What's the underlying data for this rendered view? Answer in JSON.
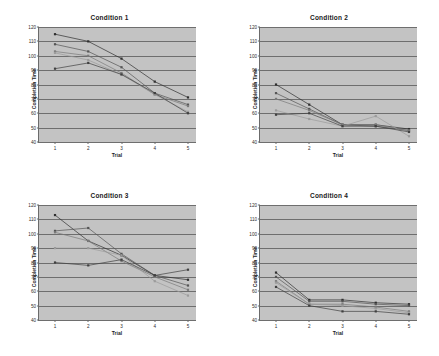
{
  "page": {
    "background": "#ffffff",
    "plot_background": "#c3c3c3",
    "gridline_color": "#6e6e6e",
    "axis_color": "#6b6b6b"
  },
  "axis": {
    "ylabel": "Completion Time",
    "xlabel": "Trial",
    "yticks": [
      "120",
      "110",
      "100",
      "90",
      "80",
      "70",
      "60",
      "50",
      "40"
    ],
    "xticks": [
      "1",
      "2",
      "3",
      "4",
      "5"
    ],
    "ymin": 40,
    "ymax": 120,
    "ystep": 10,
    "xmin": 1,
    "xmax": 5
  },
  "series_colors": [
    "#2f2f2f",
    "#555555",
    "#7a7a7a",
    "#9b9b9b",
    "#404040"
  ],
  "chart_data": [
    {
      "type": "line",
      "title": "Condition 1",
      "xlabel": "Trial",
      "ylabel": "Completion Time",
      "categories": [
        1,
        2,
        3,
        4,
        5
      ],
      "x": [
        1,
        2,
        3,
        4,
        5
      ],
      "xlim": [
        1,
        5
      ],
      "ylim": [
        40,
        120
      ],
      "grid": true,
      "legend": "none",
      "series": [
        {
          "name": "S1",
          "values": [
            115,
            110,
            98,
            82,
            71
          ]
        },
        {
          "name": "S2",
          "values": [
            108,
            103,
            92,
            74,
            66
          ]
        },
        {
          "name": "S3",
          "values": [
            103,
            100,
            88,
            73,
            65
          ]
        },
        {
          "name": "S4",
          "values": [
            102,
            97,
            87,
            73,
            61
          ]
        },
        {
          "name": "S5",
          "values": [
            91,
            95,
            87,
            74,
            60
          ]
        }
      ]
    },
    {
      "type": "line",
      "title": "Condition 2",
      "xlabel": "Trial",
      "ylabel": "Completion Time",
      "categories": [
        1,
        2,
        3,
        4,
        5
      ],
      "x": [
        1,
        2,
        3,
        4,
        5
      ],
      "xlim": [
        1,
        5
      ],
      "ylim": [
        40,
        120
      ],
      "grid": true,
      "legend": "none",
      "series": [
        {
          "name": "S1",
          "values": [
            80,
            66,
            52,
            52,
            49
          ]
        },
        {
          "name": "S2",
          "values": [
            74,
            63,
            52,
            51,
            48
          ]
        },
        {
          "name": "S3",
          "values": [
            70,
            62,
            52,
            52,
            48
          ]
        },
        {
          "name": "S4",
          "values": [
            62,
            56,
            51,
            58,
            44
          ]
        },
        {
          "name": "S5",
          "values": [
            59,
            60,
            51,
            51,
            47
          ]
        }
      ]
    },
    {
      "type": "line",
      "title": "Condition 3",
      "xlabel": "Trial",
      "ylabel": "Completion Time",
      "categories": [
        1,
        2,
        3,
        4,
        5
      ],
      "x": [
        1,
        2,
        3,
        4,
        5
      ],
      "xlim": [
        1,
        5
      ],
      "ylim": [
        40,
        120
      ],
      "grid": true,
      "legend": "none",
      "series": [
        {
          "name": "S1",
          "values": [
            113,
            95,
            85,
            71,
            68
          ]
        },
        {
          "name": "S2",
          "values": [
            102,
            104,
            86,
            71,
            64
          ]
        },
        {
          "name": "S3",
          "values": [
            101,
            95,
            81,
            70,
            61
          ]
        },
        {
          "name": "S4",
          "values": [
            90,
            90,
            85,
            67,
            57
          ]
        },
        {
          "name": "S5",
          "values": [
            80,
            78,
            82,
            71,
            75
          ]
        }
      ]
    },
    {
      "type": "line",
      "title": "Condition 4",
      "xlabel": "Trial",
      "ylabel": "Completion Time",
      "categories": [
        1,
        2,
        3,
        4,
        5
      ],
      "x": [
        1,
        2,
        3,
        4,
        5
      ],
      "xlim": [
        1,
        5
      ],
      "ylim": [
        40,
        120
      ],
      "grid": true,
      "legend": "none",
      "series": [
        {
          "name": "S1",
          "values": [
            73,
            54,
            54,
            52,
            51
          ]
        },
        {
          "name": "S2",
          "values": [
            70,
            53,
            53,
            51,
            50
          ]
        },
        {
          "name": "S3",
          "values": [
            67,
            51,
            51,
            49,
            46
          ]
        },
        {
          "name": "S4",
          "values": [
            66,
            51,
            50,
            48,
            45
          ]
        },
        {
          "name": "S5",
          "values": [
            63,
            50,
            46,
            46,
            44
          ]
        }
      ]
    }
  ]
}
